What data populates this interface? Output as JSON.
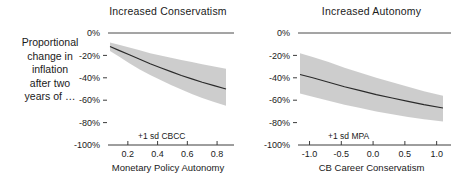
{
  "figure": {
    "side_label_lines": [
      "Proportional",
      "change in",
      "inflation",
      "after two",
      "years of …"
    ]
  },
  "chart_data": [
    {
      "type": "line",
      "panel_id": "left",
      "title": "Increased Conservatism",
      "xlabel": "Monetary Policy Autonomy",
      "ylabel": "",
      "annotation": "+1 sd CBCC",
      "xlim": [
        0.08,
        0.86
      ],
      "ylim": [
        -100,
        0
      ],
      "xticks": [
        0.2,
        0.4,
        0.6,
        0.8
      ],
      "xticklabels": [
        "0.2",
        "0.4",
        "0.6",
        "0.8"
      ],
      "yticks": [
        0,
        -20,
        -40,
        -60,
        -80,
        -100
      ],
      "yticklabels": [
        "0%",
        "-20%",
        "-40%",
        "-60%",
        "-80%",
        "-100%"
      ],
      "grid": false,
      "legend": "none",
      "zero_reference_line": 0,
      "series": [
        {
          "name": "mean",
          "x": [
            0.08,
            0.14,
            0.21,
            0.28,
            0.35,
            0.42,
            0.49,
            0.56,
            0.63,
            0.7,
            0.78,
            0.86
          ],
          "values": [
            -12.0,
            -15.5,
            -19.5,
            -23.5,
            -27.5,
            -31.0,
            -34.5,
            -38.0,
            -41.0,
            -44.0,
            -47.0,
            -50.0
          ]
        },
        {
          "name": "ci_upper",
          "x": [
            0.08,
            0.14,
            0.21,
            0.28,
            0.35,
            0.42,
            0.49,
            0.56,
            0.63,
            0.7,
            0.78,
            0.86
          ],
          "values": [
            -8.5,
            -10.5,
            -13.0,
            -15.5,
            -18.0,
            -20.0,
            -22.0,
            -24.0,
            -26.0,
            -28.0,
            -30.0,
            -32.0
          ]
        },
        {
          "name": "ci_lower",
          "x": [
            0.08,
            0.14,
            0.21,
            0.28,
            0.35,
            0.42,
            0.49,
            0.56,
            0.63,
            0.7,
            0.78,
            0.86
          ],
          "values": [
            -16.0,
            -21.0,
            -27.0,
            -32.5,
            -37.5,
            -42.0,
            -46.5,
            -50.5,
            -54.5,
            -58.0,
            -61.5,
            -65.0
          ]
        }
      ]
    },
    {
      "type": "line",
      "panel_id": "right",
      "title": "Increased Autonomy",
      "xlabel": "CB Career Conservatism",
      "ylabel": "",
      "annotation": "+1 sd MPA",
      "xlim": [
        -1.15,
        1.1
      ],
      "ylim": [
        -100,
        0
      ],
      "xticks": [
        -1.0,
        -0.5,
        0.0,
        0.5,
        1.0
      ],
      "xticklabels": [
        "-1.0",
        "-0.5",
        "0.0",
        "0.5",
        "1.0"
      ],
      "yticks": [
        0,
        -20,
        -40,
        -60,
        -80,
        -100
      ],
      "yticklabels": [
        "0%",
        "-20%",
        "-40%",
        "-60%",
        "-80%",
        "-100%"
      ],
      "grid": false,
      "legend": "none",
      "zero_reference_line": 0,
      "series": [
        {
          "name": "mean",
          "x": [
            -1.15,
            -0.95,
            -0.7,
            -0.45,
            -0.2,
            0.05,
            0.3,
            0.55,
            0.8,
            1.1
          ],
          "values": [
            -37.0,
            -40.0,
            -44.0,
            -48.0,
            -51.5,
            -55.0,
            -58.0,
            -61.0,
            -64.0,
            -67.0
          ]
        },
        {
          "name": "ci_upper",
          "x": [
            -1.15,
            -0.95,
            -0.7,
            -0.45,
            -0.2,
            0.05,
            0.3,
            0.55,
            0.8,
            1.1
          ],
          "values": [
            -18.0,
            -21.5,
            -26.0,
            -31.0,
            -35.5,
            -40.0,
            -44.0,
            -48.0,
            -52.0,
            -56.0
          ]
        },
        {
          "name": "ci_lower",
          "x": [
            -1.15,
            -0.95,
            -0.7,
            -0.45,
            -0.2,
            0.05,
            0.3,
            0.55,
            0.8,
            1.1
          ],
          "values": [
            -54.0,
            -57.0,
            -60.5,
            -64.0,
            -67.0,
            -70.0,
            -72.5,
            -75.0,
            -77.0,
            -79.0
          ]
        }
      ]
    }
  ]
}
